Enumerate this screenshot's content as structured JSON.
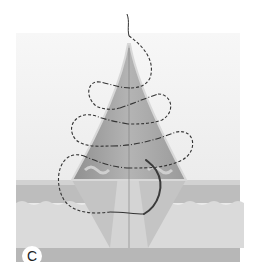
{
  "figure": {
    "panel_label": "C",
    "colors": {
      "background_top": "#f4f4f4",
      "background": "#e8e8e8",
      "cone_outer": "#9e9e9e",
      "cone_inner": "#bdbdbd",
      "cone_edge": "#d6d6d6",
      "dermis": "#c8c8c8",
      "subcutis": "#dcdcdc",
      "base": "#b5b5b5",
      "suture": "#333333",
      "needle": "#444444"
    }
  }
}
